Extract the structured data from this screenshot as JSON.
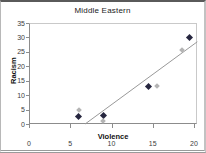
{
  "chart": {
    "title": "Middle Eastern",
    "x_axis_label": "Violence",
    "y_axis_label": "Racism"
  },
  "chart_data": {
    "type": "scatter",
    "title": "Middle Eastern",
    "xlabel": "Violence",
    "ylabel": "Racism",
    "xlim": [
      0,
      20
    ],
    "ylim": [
      0,
      35
    ],
    "x_ticks": [
      0,
      5,
      10,
      15,
      20
    ],
    "y_ticks": [
      0,
      5,
      10,
      15,
      20,
      25,
      30,
      35
    ],
    "grid": false,
    "legend": false,
    "series": [
      {
        "name": "series-dark",
        "marker": "diamond",
        "color": "#26263f",
        "points": [
          [
            6,
            2.5
          ],
          [
            9,
            3
          ],
          [
            14.5,
            13
          ],
          [
            19.5,
            30
          ]
        ]
      },
      {
        "name": "series-light",
        "marker": "diamond",
        "color": "#b4b4b4",
        "points": [
          [
            6,
            5
          ],
          [
            9,
            1
          ],
          [
            15.5,
            13
          ],
          [
            18.5,
            25.5
          ]
        ]
      }
    ],
    "trendline": {
      "x": [
        6.8,
        20.4
      ],
      "y": [
        0,
        28.5
      ],
      "color": "#999999"
    }
  },
  "colors": {
    "axis": "#8c8c8c",
    "plot_border": "#c9c9c9",
    "tick_text": "#3c3c3c",
    "title_text": "#1a1a1a"
  }
}
